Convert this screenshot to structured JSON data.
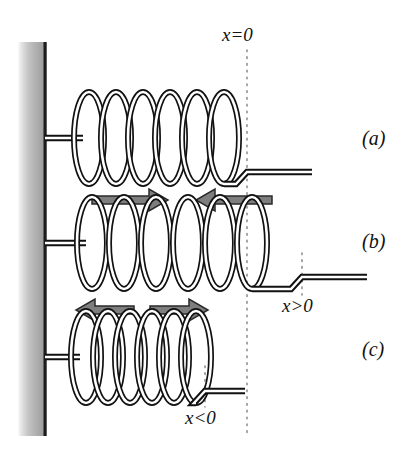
{
  "figure": {
    "background_color": "#ffffff",
    "stroke_color": "#111111",
    "arrow_fill_color": "#7b7b7b",
    "wall_light_color": "#f2f2f2",
    "wall_mid_color": "#b9b9b9",
    "wall_dark_color": "#8e8e8e",
    "wall_edge_color": "#1a1a1a",
    "dotted_line_color": "#9a9a9a"
  },
  "axis_labels": {
    "zero": {
      "text": "x=0",
      "x_var": "x",
      "operator": "=",
      "value": "0"
    },
    "positive": {
      "text": "x>0",
      "x_var": "x",
      "operator": ">",
      "value": "0"
    },
    "negative": {
      "text": "x<0",
      "x_var": "x",
      "operator": "<",
      "value": "0"
    }
  },
  "panels": [
    {
      "id": "a",
      "label": "(a)",
      "state": "relaxed",
      "description": "Spring at natural length; free end at x=0",
      "coil_count": 6,
      "end_position": "x=0",
      "arrows": []
    },
    {
      "id": "b",
      "label": "(b)",
      "state": "stretched",
      "description": "Spring stretched; free end at x>0; restoring force pulls inward",
      "coil_count": 6,
      "end_position": "x>0",
      "arrows": [
        {
          "name": "force-arrow-right",
          "direction": "right"
        },
        {
          "name": "force-arrow-left",
          "direction": "left"
        }
      ]
    },
    {
      "id": "c",
      "label": "(c)",
      "state": "compressed",
      "description": "Spring compressed; free end at x<0; restoring force pushes outward",
      "coil_count": 6,
      "end_position": "x<0",
      "arrows": [
        {
          "name": "force-arrow-left",
          "direction": "left"
        },
        {
          "name": "force-arrow-right",
          "direction": "right"
        }
      ]
    }
  ],
  "geometry": {
    "wall": {
      "x": 18,
      "y": 42,
      "width": 27,
      "height": 394
    },
    "x_zero_line_x": 247,
    "x_positive_line_x": 302,
    "x_negative_line_x": 205,
    "panel_a_axis_y": 138,
    "panel_b_axis_y": 243,
    "panel_c_axis_y": 357
  }
}
